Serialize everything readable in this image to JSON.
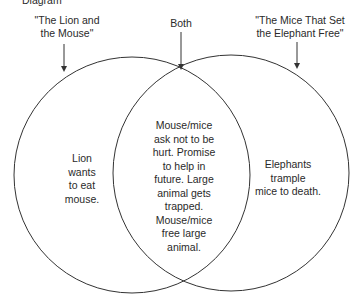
{
  "header": {
    "title": "Diagram"
  },
  "diagram": {
    "type": "venn",
    "sets": [
      {
        "label": "\"The Lion and the Mouse\"",
        "label_lines": [
          "\"The Lion and",
          "the Mouse\""
        ],
        "unique_text": "Lion wants to eat mouse.",
        "unique_lines": [
          "Lion",
          "wants",
          "to eat",
          "mouse."
        ]
      },
      {
        "label": "\"The Mice That Set the Elephant Free\"",
        "label_lines": [
          "\"The Mice That Set",
          "the Elephant Free\""
        ],
        "unique_text": "Elephants trample mice to death.",
        "unique_lines": [
          "Elephants",
          "trample",
          "mice to death."
        ]
      }
    ],
    "intersection": {
      "label": "Both",
      "text": "Mouse/mice ask not to be hurt. Promise to help in future. Large animal gets trapped. Mouse/mice free large animal.",
      "lines": [
        "Mouse/mice",
        "ask not to be",
        "hurt. Promise",
        "to help in",
        "future. Large",
        "animal gets",
        "trapped.",
        "Mouse/mice",
        "free large",
        "animal."
      ]
    },
    "colors": {
      "stroke": "#333333",
      "background": "#ffffff",
      "text": "#2a2a2a"
    }
  }
}
